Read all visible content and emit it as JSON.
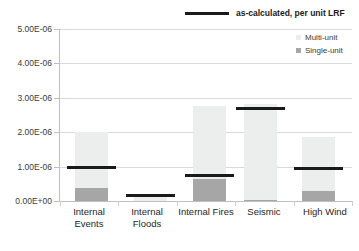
{
  "chart_data": {
    "type": "bar",
    "title": "",
    "subtitle": "",
    "xlabel": "",
    "ylabel": "",
    "ylim": [
      0,
      5e-06
    ],
    "grid": true,
    "categories": [
      "Internal Events",
      "Internal Floods",
      "Internal Fires",
      "Seismic",
      "High Wind"
    ],
    "category_lines": [
      [
        "Internal",
        "Events"
      ],
      [
        "Internal",
        "Floods"
      ],
      [
        "Internal",
        "Fires"
      ],
      [
        "Seismic",
        ""
      ],
      [
        "High Wind",
        ""
      ]
    ],
    "ytick_labels": [
      "0.00E+00",
      "1.00E-06",
      "2.00E-06",
      "3.00E-06",
      "4.00E-06",
      "5.00E-06"
    ],
    "ytick_values": [
      0,
      1e-06,
      2e-06,
      3e-06,
      4e-06,
      5e-06
    ],
    "series": [
      {
        "name": "Multi-unit",
        "type": "stacked-bar-top",
        "color": "#eceded",
        "values": [
          2e-06,
          1.2e-07,
          2.75e-06,
          2.82e-06,
          1.87e-06
        ]
      },
      {
        "name": "Single-unit",
        "type": "stacked-bar-bottom",
        "color": "#a6a6a6",
        "values": [
          3.8e-07,
          0.0,
          6.3e-07,
          4e-08,
          2.9e-07
        ]
      },
      {
        "name": "as-calculated, per unit LRF",
        "type": "line-marker",
        "color": "#1a1a1a",
        "values": [
          1e-06,
          1.8e-07,
          7.6e-07,
          2.7e-06,
          9.6e-07
        ]
      }
    ],
    "legend_top": {
      "label": "as-calculated, per unit LRF",
      "marker": "horizontal-line",
      "color": "#1a1a1a",
      "position": "top-center-right"
    },
    "legend_inner": {
      "position": "top-right-inside-plot",
      "entries": [
        {
          "label": "Multi-unit",
          "color": "#eceded"
        },
        {
          "label": "Single-unit",
          "color": "#a6a6a6"
        }
      ]
    }
  }
}
